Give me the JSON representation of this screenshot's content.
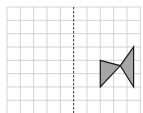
{
  "diagram": {
    "type": "grid-reflection",
    "grid": {
      "columns": 10,
      "rows": 8,
      "cell_size": 13.33,
      "origin_x": 7,
      "origin_y": 7,
      "line_color": "#c8c8c8"
    },
    "axis_of_symmetry": {
      "style": "dashed",
      "column_index": 5,
      "color": "#333333"
    },
    "shape": {
      "fill": "#a6a6a6",
      "stroke": "#1a1a1a",
      "grid_vertices": [
        [
          7,
          4
        ],
        [
          8.5,
          4.4
        ],
        [
          9.5,
          3
        ],
        [
          9.5,
          6
        ],
        [
          8.5,
          4.4
        ],
        [
          7,
          6
        ]
      ]
    }
  }
}
